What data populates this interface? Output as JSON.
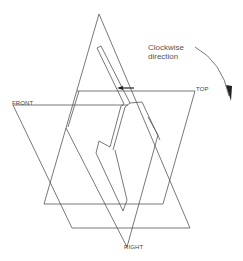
{
  "labels": {
    "front": "FRONT",
    "top": "TOP",
    "right": "RIGHT"
  },
  "annotation": {
    "line1": "Clockwise",
    "line2": "direction"
  },
  "icons": {
    "rotation_arrow": "curved-arrow-clockwise",
    "direction_arrow": "arrow-left"
  },
  "colors": {
    "stroke": "#555555",
    "text": "#444444",
    "background": "#ffffff"
  }
}
